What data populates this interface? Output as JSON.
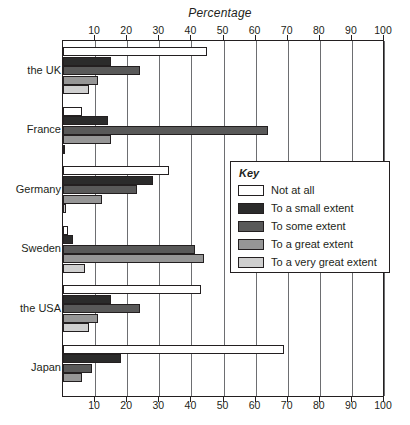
{
  "chart_data": {
    "type": "bar",
    "orientation": "horizontal",
    "title": "Percentage",
    "xlabel": "Percentage",
    "ylabel": "",
    "xlim": [
      0,
      100
    ],
    "xticks": [
      0,
      10,
      20,
      30,
      40,
      50,
      60,
      70,
      80,
      90,
      100
    ],
    "xtick_labels": [
      "",
      "10",
      "20",
      "30",
      "40",
      "50",
      "60",
      "70",
      "80",
      "90",
      "100"
    ],
    "grid": true,
    "grid_axis": "x",
    "axis_duplicate_bottom": true,
    "legend_position": "middle-right",
    "legend_title": "Key",
    "categories": [
      "the UK",
      "France",
      "Germany",
      "Sweden",
      "the USA",
      "Japan"
    ],
    "series": [
      {
        "name": "Not at all",
        "color": "#ffffff",
        "values": [
          45,
          6,
          33,
          1.5,
          43,
          69
        ]
      },
      {
        "name": "To a small extent",
        "color": "#2b2b2b",
        "values": [
          15,
          14,
          28,
          3,
          15,
          18
        ]
      },
      {
        "name": "To some extent",
        "color": "#595959",
        "values": [
          24,
          64,
          23,
          41,
          24,
          9
        ]
      },
      {
        "name": "To a great extent",
        "color": "#969696",
        "values": [
          11,
          15,
          12,
          44,
          11,
          6
        ]
      },
      {
        "name": "To a very great extent",
        "color": "#cfcfcf",
        "values": [
          8,
          0.6,
          1,
          7,
          8,
          0
        ]
      }
    ]
  },
  "legend": {
    "title": "Key",
    "items": [
      {
        "label": "Not at all"
      },
      {
        "label": "To a small extent"
      },
      {
        "label": "To some extent"
      },
      {
        "label": "To a great extent"
      },
      {
        "label": "To a very great extent"
      }
    ]
  }
}
